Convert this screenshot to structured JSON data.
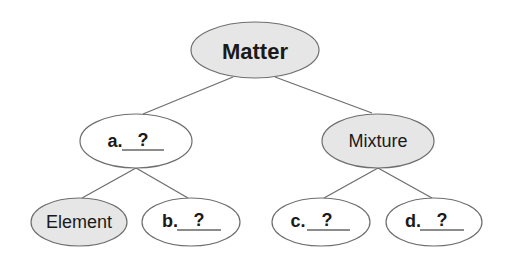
{
  "diagram": {
    "colors": {
      "shaded_fill": "#e6e6e6",
      "plain_fill": "#ffffff",
      "stroke": "#6e6e6e",
      "text": "#1a1a1a"
    },
    "nodes": {
      "root": {
        "label": "Matter",
        "shaded": true,
        "bold": true
      },
      "a": {
        "prefix": "a.",
        "answer": "?",
        "shaded": false
      },
      "mixture": {
        "label": "Mixture",
        "shaded": true
      },
      "element": {
        "label": "Element",
        "shaded": true
      },
      "b": {
        "prefix": "b.",
        "answer": "?",
        "shaded": false
      },
      "c": {
        "prefix": "c.",
        "answer": "?",
        "shaded": false
      },
      "d": {
        "prefix": "d.",
        "answer": "?",
        "shaded": false
      }
    },
    "edges": [
      [
        "root",
        "a"
      ],
      [
        "root",
        "mixture"
      ],
      [
        "a",
        "element"
      ],
      [
        "a",
        "b"
      ],
      [
        "mixture",
        "c"
      ],
      [
        "mixture",
        "d"
      ]
    ]
  }
}
